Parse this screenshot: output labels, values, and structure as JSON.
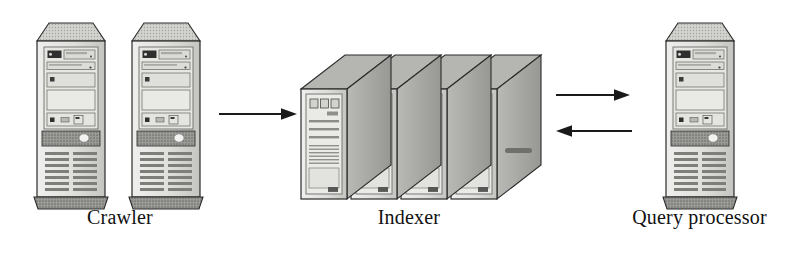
{
  "diagram": {
    "type": "architecture-flow",
    "background_color": "#ffffff",
    "nodes": [
      {
        "id": "crawler",
        "label": "Crawler",
        "icon": "desktop-tower-computer",
        "machine_count": 2,
        "position": "left"
      },
      {
        "id": "indexer",
        "label": "Indexer",
        "icon": "server-rack-stack",
        "machine_count": 4,
        "position": "center"
      },
      {
        "id": "query_processor",
        "label": "Query processor",
        "icon": "desktop-tower-computer",
        "machine_count": 1,
        "position": "right"
      }
    ],
    "connections": [
      {
        "id": "crawler-to-indexer",
        "from": "crawler",
        "to": "indexer",
        "direction": "right"
      },
      {
        "id": "indexer-to-query",
        "from": "indexer",
        "to": "query_processor",
        "direction": "right"
      },
      {
        "id": "query-to-indexer",
        "from": "query_processor",
        "to": "indexer",
        "direction": "left"
      }
    ],
    "colors": {
      "outline": "#2b2b2b",
      "case_light": "#e3e3e1",
      "case_mid": "#c8c8c5",
      "case_dark": "#a8a8a5",
      "panel_band": "#8d8d8a",
      "base_dark": "#8a8a87",
      "vent_line": "#7c7c79",
      "arrow": "#1a1a1a",
      "label_text": "#111111"
    }
  }
}
